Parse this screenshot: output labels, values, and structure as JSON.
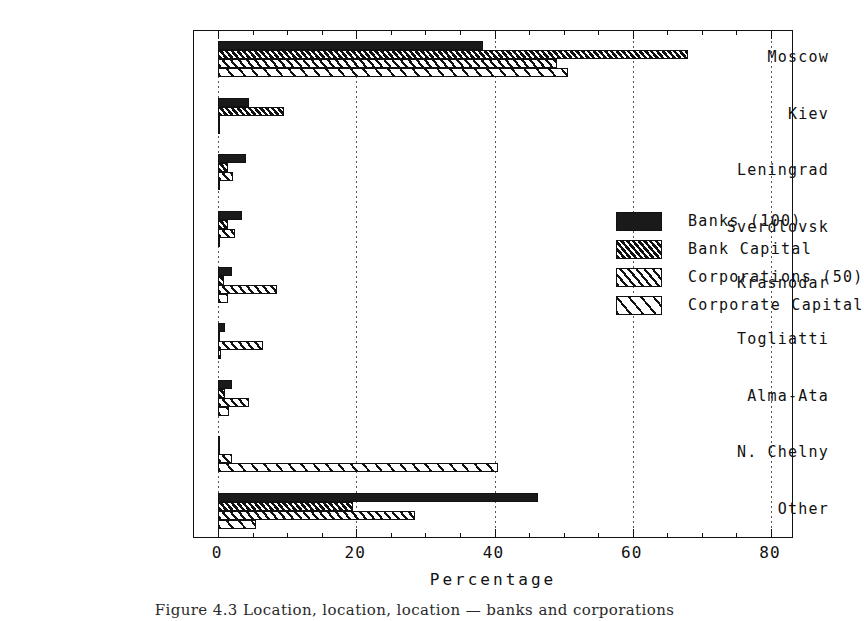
{
  "chart_data": {
    "type": "bar",
    "orientation": "horizontal",
    "title": "",
    "xlabel": "Percentage",
    "ylabel": "",
    "xlim": [
      0,
      83
    ],
    "xticks": [
      0,
      20,
      40,
      60,
      80
    ],
    "xtick_labels": [
      "0",
      "20",
      "40",
      "60",
      "80"
    ],
    "minor_tick_step": 5,
    "grid": "vertical-dotted-at-major-ticks",
    "legend_position": "inside-upper-center-right",
    "categories": [
      "Moscow",
      "Kiev",
      "Leningrad",
      "Sverdlovsk",
      "Krasnodar",
      "Togliatti",
      "Alma-Ata",
      "N. Chelny",
      "Other"
    ],
    "series": [
      {
        "name": "Banks (100)",
        "pattern": "solid-black",
        "values": [
          38.4,
          4.5,
          4.0,
          3.5,
          2.0,
          1.0,
          2.0,
          0.0,
          46.3
        ]
      },
      {
        "name": "Bank Capital",
        "pattern": "dense-hatch",
        "values": [
          68.0,
          9.5,
          1.5,
          1.5,
          0.8,
          0.3,
          1.0,
          0.0,
          19.5
        ]
      },
      {
        "name": "Corporations (50)",
        "pattern": "medium-hatch",
        "values": [
          49.0,
          0.0,
          2.2,
          2.5,
          8.5,
          6.5,
          4.5,
          2.0,
          28.5
        ]
      },
      {
        "name": "Corporate Capital",
        "pattern": "sparse-hatch",
        "values": [
          50.6,
          0.0,
          0.0,
          0.0,
          1.5,
          0.4,
          1.6,
          40.5,
          5.5
        ]
      }
    ]
  },
  "caption": "Figure 4.3  Location, location, location — banks and corporations"
}
